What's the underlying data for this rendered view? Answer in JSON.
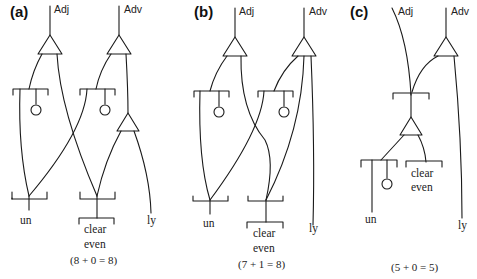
{
  "figure": {
    "panels": [
      {
        "id": "a",
        "label": "(a)",
        "top_labels": {
          "adj": "Adj",
          "adv": "Adv"
        },
        "words": {
          "un": "un",
          "clear": "clear",
          "even": "even",
          "ly": "ly"
        },
        "formula": "(8 + 0 = 8)"
      },
      {
        "id": "b",
        "label": "(b)",
        "top_labels": {
          "adj": "Adj",
          "adv": "Adv"
        },
        "words": {
          "un": "un",
          "clear": "clear",
          "even": "even",
          "ly": "ly"
        },
        "formula": "(7 + 1 = 8)"
      },
      {
        "id": "c",
        "label": "(c)",
        "top_labels": {
          "adj": "Adj",
          "adv": "Adv"
        },
        "words": {
          "un": "un",
          "clear": "clear",
          "even": "even",
          "ly": "ly"
        },
        "formula": "(5 + 0 = 5)"
      }
    ],
    "colors": {
      "ink": "#1a1a1a",
      "background": "#ffffff"
    }
  }
}
